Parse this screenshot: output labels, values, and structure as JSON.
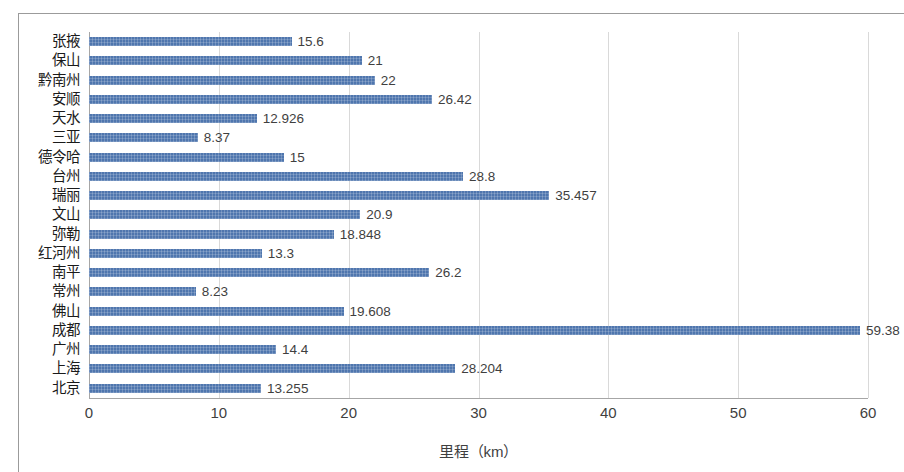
{
  "chart_data": {
    "type": "bar",
    "orientation": "horizontal",
    "title": "",
    "xlabel": "里程（km）",
    "ylabel": "",
    "xlim": [
      0,
      60
    ],
    "xticks": [
      "0",
      "10",
      "20",
      "30",
      "40",
      "50",
      "60"
    ],
    "xtick_values": [
      0,
      10,
      20,
      30,
      40,
      50,
      60
    ],
    "grid": "vertical",
    "legend": "none",
    "bar_color": "#4f76ae",
    "categories": [
      "张掖",
      "保山",
      "黔南州",
      "安顺",
      "天水",
      "三亚",
      "德令哈",
      "台州",
      "瑞丽",
      "文山",
      "弥勒",
      "红河州",
      "南平",
      "常州",
      "佛山",
      "成都",
      "广州",
      "上海",
      "北京"
    ],
    "values": [
      15.6,
      21,
      22,
      26.42,
      12.926,
      8.37,
      15,
      28.8,
      35.457,
      20.9,
      18.848,
      13.3,
      26.2,
      8.23,
      19.608,
      59.38,
      14.4,
      28.204,
      13.255
    ],
    "value_labels": [
      "15.6",
      "21",
      "22",
      "26.42",
      "12.926",
      "8.37",
      "15",
      "28.8",
      "35.457",
      "20.9",
      "18.848",
      "13.3",
      "26.2",
      "8.23",
      "19.608",
      "59.38",
      "14.4",
      "28.204",
      "13.255"
    ]
  }
}
